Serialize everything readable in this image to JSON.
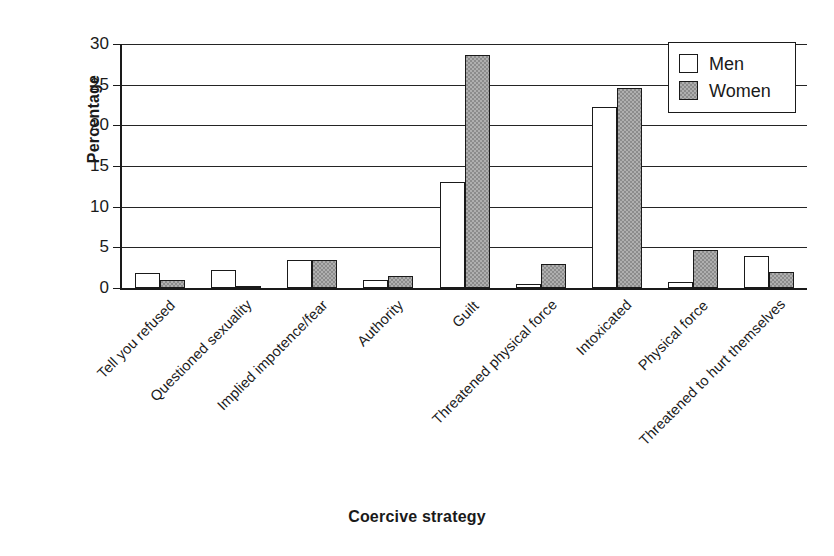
{
  "chart_data": {
    "type": "bar",
    "title": "",
    "xlabel": "Coercive strategy",
    "ylabel": "Percentage",
    "ylim": [
      0,
      30
    ],
    "yticks": [
      0,
      5,
      10,
      15,
      20,
      25,
      30
    ],
    "grid": true,
    "legend_position": "top-right",
    "categories": [
      "Tell you refused",
      "Questioned sexuality",
      "Implied impotence/fear",
      "Authority",
      "Guilt",
      "Threatened physical force",
      "Intoxicated",
      "Physical force",
      "Threatened to hurt themselves"
    ],
    "series": [
      {
        "name": "Men",
        "color": "#ffffff",
        "values": [
          1.9,
          2.2,
          3.4,
          1.0,
          13.0,
          0.5,
          22.2,
          0.8,
          3.9
        ]
      },
      {
        "name": "Women",
        "color": "#8c8c8c",
        "values": [
          1.0,
          0.3,
          3.4,
          1.5,
          28.6,
          2.9,
          24.6,
          4.7,
          2.0
        ]
      }
    ]
  },
  "legend": {
    "items": [
      {
        "label": "Men",
        "swatch": "men"
      },
      {
        "label": "Women",
        "swatch": "women"
      }
    ]
  },
  "axes": {
    "y_title": "Percentage",
    "x_title": "Coercive strategy"
  }
}
